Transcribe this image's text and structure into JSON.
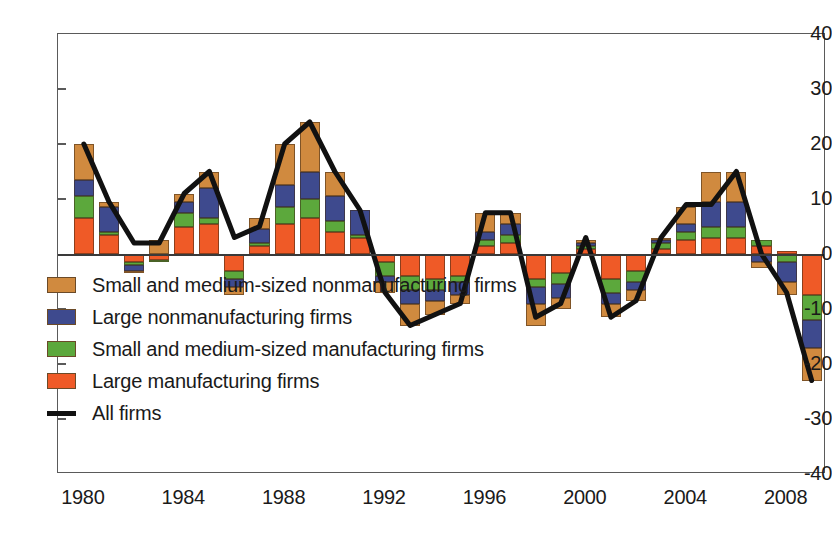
{
  "chart_data": {
    "type": "bar",
    "subtype": "stacked-bar-with-line-overlay",
    "title": "",
    "xlabel": "",
    "ylabel": "",
    "ylim": [
      -40,
      40
    ],
    "ytick_values": [
      40,
      30,
      20,
      10,
      0,
      -10,
      -20,
      -30,
      -40
    ],
    "ytick_labels": [
      "40",
      "30",
      "20",
      "10",
      "0",
      "-10",
      "-20",
      "-30",
      "-40"
    ],
    "xtick_labels": [
      "1980",
      "1984",
      "1988",
      "1992",
      "1996",
      "2000",
      "2004",
      "2008"
    ],
    "xtick_years": [
      1980,
      1984,
      1988,
      1992,
      1996,
      2000,
      2004,
      2008
    ],
    "grid": false,
    "legend_position": "inside-lower-left",
    "categories": [
      1980,
      1981,
      1982,
      1983,
      1984,
      1985,
      1986,
      1987,
      1988,
      1989,
      1990,
      1991,
      1992,
      1993,
      1994,
      1995,
      1996,
      1997,
      1998,
      1999,
      2000,
      2001,
      2002,
      2003,
      2004,
      2005,
      2006,
      2007,
      2008,
      2009
    ],
    "series": [
      {
        "name": "Large manufacturing firms",
        "color": "#EF5A27",
        "stack_order": 1,
        "values": [
          6.5,
          3.5,
          -1.5,
          -1.0,
          5.0,
          5.5,
          -3.0,
          1.5,
          5.5,
          6.5,
          4.0,
          3.0,
          -1.5,
          -4.0,
          -4.5,
          -4.0,
          1.5,
          2.0,
          -4.5,
          -3.5,
          1.0,
          -4.5,
          -3.0,
          1.0,
          2.5,
          3.0,
          3.0,
          1.5,
          0.5,
          -7.5
        ]
      },
      {
        "name": "Small and medium-sized manufacturing firms",
        "color": "#5CA83C",
        "stack_order": 2,
        "values": [
          4.0,
          0.5,
          -0.5,
          -0.5,
          2.5,
          1.0,
          -1.5,
          0.5,
          3.0,
          3.5,
          2.0,
          0.5,
          -2.5,
          -2.5,
          -2.0,
          -1.0,
          1.0,
          1.5,
          -1.5,
          -2.0,
          0.5,
          -2.5,
          -2.0,
          1.0,
          1.5,
          2.0,
          2.0,
          1.0,
          -1.5,
          -4.5
        ]
      },
      {
        "name": "Large nonmanufacturing firms",
        "color": "#3E4A8E",
        "stack_order": 3,
        "values": [
          3.0,
          4.5,
          -1.0,
          0.0,
          2.0,
          5.5,
          -1.5,
          2.5,
          4.0,
          5.0,
          4.5,
          4.5,
          -1.0,
          -2.5,
          -2.0,
          -2.5,
          1.5,
          2.0,
          -3.0,
          -2.5,
          0.5,
          -2.0,
          -1.5,
          0.5,
          1.5,
          4.5,
          4.5,
          -1.5,
          -3.5,
          -5.0
        ]
      },
      {
        "name": "Small and medium-sized nonmanufacturing firms",
        "color": "#D08A3F",
        "stack_order": 4,
        "values": [
          6.5,
          1.0,
          -0.5,
          2.5,
          1.5,
          3.0,
          -1.5,
          2.0,
          7.5,
          9.0,
          4.5,
          0.0,
          -2.0,
          -4.0,
          -2.5,
          -1.5,
          3.5,
          2.0,
          -4.0,
          -2.0,
          0.5,
          -2.5,
          -2.0,
          0.5,
          3.0,
          5.5,
          5.5,
          -1.0,
          -2.5,
          -6.0
        ]
      }
    ],
    "line_series": {
      "name": "All firms",
      "color": "#111111",
      "values": [
        20.0,
        9.5,
        2.0,
        2.0,
        11.0,
        15.0,
        3.0,
        5.0,
        20.0,
        24.0,
        15.0,
        8.0,
        -7.0,
        -13.0,
        -11.0,
        -9.0,
        7.5,
        7.5,
        -11.5,
        -9.0,
        3.0,
        -11.5,
        -8.5,
        3.0,
        9.0,
        9.0,
        15.0,
        0.0,
        -7.0,
        -23.0
      ]
    },
    "legend_entries": [
      {
        "label": "Small and medium-sized nonmanufacturing firms",
        "color": "#D08A3F",
        "marker": "swatch"
      },
      {
        "label": "Large nonmanufacturing firms",
        "color": "#3E4A8E",
        "marker": "swatch"
      },
      {
        "label": "Small and medium-sized manufacturing firms",
        "color": "#5CA83C",
        "marker": "swatch"
      },
      {
        "label": "Large manufacturing firms",
        "color": "#EF5A27",
        "marker": "swatch"
      },
      {
        "label": "All firms",
        "color": "#111111",
        "marker": "line"
      }
    ]
  }
}
